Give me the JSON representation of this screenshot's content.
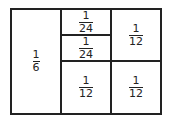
{
  "diagram": {
    "type": "area-partition",
    "outer": {
      "x": 10,
      "y": 8,
      "w": 151,
      "h": 106
    },
    "line_color": "#222222",
    "cells": [
      {
        "id": "c1",
        "x": 10,
        "y": 8,
        "w": 51,
        "h": 106,
        "num": "1",
        "den": "6"
      },
      {
        "id": "c2",
        "x": 61,
        "y": 8,
        "w": 50,
        "h": 27,
        "num": "1",
        "den": "24"
      },
      {
        "id": "c3",
        "x": 61,
        "y": 35,
        "w": 50,
        "h": 26,
        "num": "1",
        "den": "24"
      },
      {
        "id": "c4",
        "x": 61,
        "y": 61,
        "w": 50,
        "h": 53,
        "num": "1",
        "den": "12"
      },
      {
        "id": "c5",
        "x": 111,
        "y": 8,
        "w": 50,
        "h": 53,
        "num": "1",
        "den": "12"
      },
      {
        "id": "c6",
        "x": 111,
        "y": 61,
        "w": 50,
        "h": 53,
        "num": "1",
        "den": "12"
      }
    ]
  }
}
